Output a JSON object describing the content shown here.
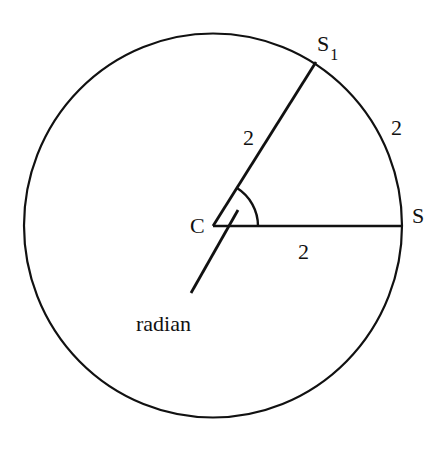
{
  "diagram": {
    "labels": {
      "center": "C",
      "point_s": "S",
      "point_s1_base": "S",
      "point_s1_sub": "1",
      "radius_to_s1": "2",
      "arc_length": "2",
      "radius_to_s": "2",
      "angle_label": "radian"
    },
    "colors": {
      "stroke": "#111111",
      "background": "#ffffff"
    },
    "geometry": {
      "center": [
        213,
        226
      ],
      "radius": 190,
      "s1_point": [
        316,
        62
      ],
      "s_point": [
        402,
        226
      ]
    }
  }
}
